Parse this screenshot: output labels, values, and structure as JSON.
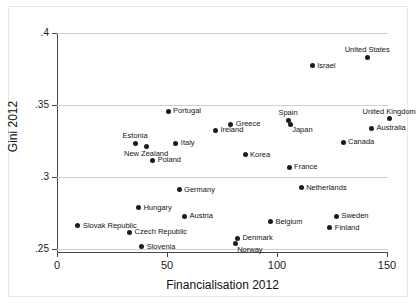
{
  "chart_data": {
    "type": "scatter",
    "title": "",
    "xlabel": "Financialisation 2012",
    "ylabel": "Gini 2012",
    "xlim": [
      -4,
      161
    ],
    "ylim": [
      0.2465,
      0.4025
    ],
    "xticks": [
      "0",
      "50",
      "100",
      "150"
    ],
    "xtick_values": [
      0,
      50,
      100,
      150
    ],
    "yticks": [
      ".25",
      ".3",
      ".35",
      ".4"
    ],
    "ytick_values": [
      0.25,
      0.3,
      0.35,
      0.4
    ],
    "grid": "horizontal",
    "legend": "none",
    "marker_color": "#1c1c1c",
    "grid_color": "#cfcfcf",
    "axis_color": "#4a4a4a",
    "points": [
      {
        "label": "United States",
        "x": 141,
        "y": 0.3833,
        "pos": "above"
      },
      {
        "label": "Israel",
        "x": 116,
        "y": 0.3771,
        "pos": "right"
      },
      {
        "label": "Portugal",
        "x": 50.5,
        "y": 0.3457,
        "pos": "right"
      },
      {
        "label": "United Kingdom",
        "x": 151,
        "y": 0.3406,
        "pos": "above"
      },
      {
        "label": "Spain",
        "x": 105,
        "y": 0.3393,
        "pos": "above"
      },
      {
        "label": "Japan",
        "x": 106,
        "y": 0.3368,
        "pos": "br"
      },
      {
        "label": "Greece",
        "x": 79,
        "y": 0.3368,
        "pos": "right"
      },
      {
        "label": "Australia",
        "x": 143,
        "y": 0.3338,
        "pos": "right"
      },
      {
        "label": "Ireland",
        "x": 72,
        "y": 0.3326,
        "pos": "right"
      },
      {
        "label": "Canada",
        "x": 130,
        "y": 0.3243,
        "pos": "right"
      },
      {
        "label": "Estonia",
        "x": 35.5,
        "y": 0.3236,
        "pos": "above"
      },
      {
        "label": "Italy",
        "x": 54,
        "y": 0.3236,
        "pos": "right"
      },
      {
        "label": "New Zealand",
        "x": 40.5,
        "y": 0.3215,
        "pos": "below"
      },
      {
        "label": "Korea",
        "x": 85.5,
        "y": 0.3153,
        "pos": "right"
      },
      {
        "label": "Poland",
        "x": 43.5,
        "y": 0.3118,
        "pos": "right"
      },
      {
        "label": "France",
        "x": 105.5,
        "y": 0.3069,
        "pos": "right"
      },
      {
        "label": "Netherlands",
        "x": 111,
        "y": 0.2924,
        "pos": "right"
      },
      {
        "label": "Germany",
        "x": 55.5,
        "y": 0.291,
        "pos": "right"
      },
      {
        "label": "Hungary",
        "x": 37,
        "y": 0.2785,
        "pos": "right"
      },
      {
        "label": "Sweden",
        "x": 127,
        "y": 0.2729,
        "pos": "right"
      },
      {
        "label": "Austria",
        "x": 58,
        "y": 0.2729,
        "pos": "right"
      },
      {
        "label": "Belgium",
        "x": 97,
        "y": 0.2688,
        "pos": "right"
      },
      {
        "label": "Slovak Republic",
        "x": 9.5,
        "y": 0.266,
        "pos": "right"
      },
      {
        "label": "Finland",
        "x": 124,
        "y": 0.2646,
        "pos": "right"
      },
      {
        "label": "Czech Republic",
        "x": 33,
        "y": 0.2618,
        "pos": "right"
      },
      {
        "label": "Denmark",
        "x": 82,
        "y": 0.2576,
        "pos": "right"
      },
      {
        "label": "Norway",
        "x": 81,
        "y": 0.2535,
        "pos": "br"
      },
      {
        "label": "Slovenia",
        "x": 38.5,
        "y": 0.2514,
        "pos": "right"
      }
    ]
  }
}
